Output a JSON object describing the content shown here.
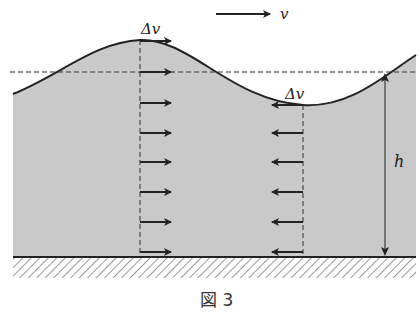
{
  "figure": {
    "caption": "図 3",
    "legend_arrow_label": "v",
    "crest_label": "Δv",
    "trough_label": "Δv",
    "depth_label": "h"
  },
  "colors": {
    "water_fill": "#c9c9c9",
    "line": "#222222",
    "background": "#ffffff"
  },
  "elements": {
    "crest_arrows_direction": "right",
    "trough_arrows_direction": "left",
    "arrow_count_per_column": 7
  }
}
